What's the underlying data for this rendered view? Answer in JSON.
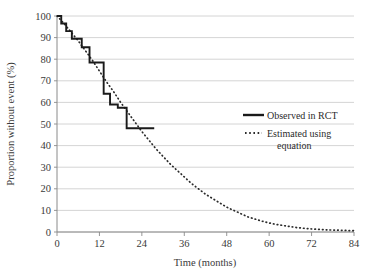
{
  "chart_data": {
    "type": "line",
    "title": "",
    "xlabel": "Time (months)",
    "ylabel": "Proportion without event (%)",
    "xlim": [
      0,
      84
    ],
    "ylim": [
      0,
      100
    ],
    "xticks": [
      "0",
      "12",
      "24",
      "36",
      "48",
      "60",
      "72",
      "84"
    ],
    "xtick_values": [
      0,
      12,
      24,
      36,
      48,
      60,
      72,
      84
    ],
    "yticks": [
      "0",
      "10",
      "20",
      "30",
      "40",
      "50",
      "60",
      "70",
      "80",
      "90",
      "100"
    ],
    "ytick_values": [
      0,
      10,
      20,
      30,
      40,
      50,
      60,
      70,
      80,
      90,
      100
    ],
    "grid": "horizontal",
    "legend_position": "right-middle",
    "series": [
      {
        "name": "Observed in RCT",
        "style": "step-solid",
        "color": "#1a1a1a",
        "points": [
          [
            0,
            100
          ],
          [
            1.2,
            100
          ],
          [
            1.2,
            96.5
          ],
          [
            2.6,
            96.5
          ],
          [
            2.6,
            93
          ],
          [
            4.2,
            93
          ],
          [
            4.2,
            89.5
          ],
          [
            7.0,
            89.5
          ],
          [
            7.0,
            85.5
          ],
          [
            9.2,
            85.5
          ],
          [
            9.2,
            78.5
          ],
          [
            13.2,
            78.5
          ],
          [
            13.2,
            64
          ],
          [
            15.0,
            64
          ],
          [
            15.0,
            59
          ],
          [
            17.2,
            59
          ],
          [
            17.2,
            57.5
          ],
          [
            19.7,
            57.5
          ],
          [
            19.7,
            48
          ],
          [
            27.5,
            48
          ]
        ]
      },
      {
        "name": "Estimated using equation",
        "style": "dotted",
        "color": "#2b2b2b",
        "points": [
          [
            0,
            100
          ],
          [
            2,
            96.5
          ],
          [
            4,
            92.5
          ],
          [
            6,
            88.5
          ],
          [
            8,
            84
          ],
          [
            10,
            79.5
          ],
          [
            12,
            74.5
          ],
          [
            14,
            69.5
          ],
          [
            16,
            65
          ],
          [
            18,
            60
          ],
          [
            20,
            55.5
          ],
          [
            22,
            51
          ],
          [
            24,
            46.5
          ],
          [
            26,
            42.5
          ],
          [
            28,
            38.5
          ],
          [
            30,
            35
          ],
          [
            32,
            31.5
          ],
          [
            34,
            28.5
          ],
          [
            36,
            25.5
          ],
          [
            38,
            22.5
          ],
          [
            40,
            20
          ],
          [
            42,
            17.5
          ],
          [
            44,
            15.5
          ],
          [
            46,
            13.5
          ],
          [
            48,
            11.5
          ],
          [
            50,
            10
          ],
          [
            52,
            8.5
          ],
          [
            54,
            7
          ],
          [
            56,
            6
          ],
          [
            58,
            5
          ],
          [
            60,
            4.2
          ],
          [
            62,
            3.5
          ],
          [
            64,
            3
          ],
          [
            66,
            2.5
          ],
          [
            68,
            2
          ],
          [
            70,
            1.7
          ],
          [
            72,
            1.4
          ],
          [
            74,
            1.2
          ],
          [
            76,
            1
          ],
          [
            78,
            0.9
          ],
          [
            80,
            0.8
          ],
          [
            82,
            0.7
          ],
          [
            84,
            0.6
          ]
        ]
      }
    ]
  },
  "legend": {
    "items": [
      {
        "label": "Observed in RCT",
        "marker": "solid-line"
      },
      {
        "label": "Estimated using",
        "label2": "equation",
        "marker": "dotted-line"
      }
    ]
  },
  "colors": {
    "series_observed": "#1a1a1a",
    "series_estimated": "#2b2b2b",
    "gridline": "#c9c9c9",
    "axis": "#8a8a8a",
    "text": "#3a3a3a",
    "background": "#ffffff"
  }
}
